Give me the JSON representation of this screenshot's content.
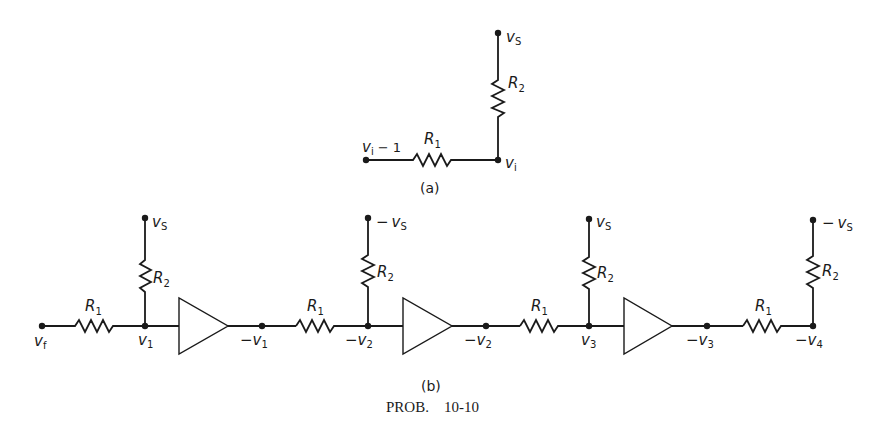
{
  "figure": {
    "caption": "PROB.    10-10",
    "part_a": {
      "label": "(a)",
      "top_node": "v",
      "top_node_sub": "S",
      "left_node": "v",
      "left_node_sub": "i",
      "left_node_suffix": " − 1",
      "right_node": "v",
      "right_node_sub": "i",
      "r_horizontal": "R",
      "r_horizontal_sub": "1",
      "r_vertical": "R",
      "r_vertical_sub": "2"
    },
    "part_b": {
      "label": "(b)",
      "input": {
        "name": "v",
        "sub": "f"
      },
      "stages": [
        {
          "supply": "v",
          "supply_sub": "S",
          "supply_sign": "",
          "node": "v",
          "node_sub": "1",
          "node_sign": "",
          "output": "v",
          "output_sub": "1",
          "output_sign": "−"
        },
        {
          "supply": "v",
          "supply_sub": "S",
          "supply_sign": "−",
          "node": "v",
          "node_sub": "2",
          "node_sign": "−",
          "output": "v",
          "output_sub": "2",
          "output_sign": "−"
        },
        {
          "supply": "v",
          "supply_sub": "S",
          "supply_sign": "",
          "node": "v",
          "node_sub": "3",
          "node_sign": "",
          "output": "v",
          "output_sub": "3",
          "output_sign": "−"
        },
        {
          "supply": "v",
          "supply_sub": "S",
          "supply_sign": "−",
          "node": "v",
          "node_sub": "4",
          "node_sign": "−"
        }
      ],
      "r1": "R",
      "r1_sub": "1",
      "r2": "R",
      "r2_sub": "2"
    }
  }
}
